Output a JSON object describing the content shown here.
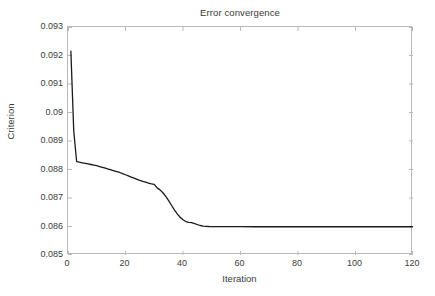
{
  "chart_data": {
    "type": "line",
    "title": "Error convergence",
    "xlabel": "Iteration",
    "ylabel": "Criterion",
    "xlim": [
      0,
      120
    ],
    "ylim": [
      0.085,
      0.093
    ],
    "xticks": [
      0,
      20,
      40,
      60,
      80,
      100,
      120
    ],
    "xtick_labels": [
      "0",
      "20",
      "40",
      "60",
      "80",
      "100",
      "120"
    ],
    "yticks": [
      0.085,
      0.086,
      0.087,
      0.088,
      0.089,
      0.09,
      0.091,
      0.092,
      0.093
    ],
    "ytick_labels": [
      "0.085",
      "0.086",
      "0.087",
      "0.088",
      "0.089",
      "0.09",
      "0.091",
      "0.092",
      "0.093"
    ],
    "grid": false,
    "legend": null,
    "line_color": "#1a1a1a",
    "line_width": 1.3,
    "series": [
      {
        "name": "Criterion",
        "x": [
          1,
          2,
          3,
          4,
          5,
          6,
          7,
          8,
          9,
          10,
          11,
          12,
          13,
          14,
          15,
          16,
          17,
          18,
          19,
          20,
          21,
          22,
          23,
          24,
          25,
          26,
          27,
          28,
          29,
          30,
          31,
          32,
          33,
          34,
          35,
          36,
          37,
          38,
          39,
          40,
          41,
          42,
          43,
          44,
          45,
          46,
          47,
          48,
          49,
          50,
          52,
          54,
          56,
          58,
          60,
          65,
          70,
          75,
          80,
          85,
          90,
          95,
          100,
          105,
          110,
          115,
          120
        ],
        "y": [
          0.09215,
          0.08935,
          0.08828,
          0.088255,
          0.088235,
          0.088215,
          0.088195,
          0.088175,
          0.088155,
          0.088135,
          0.088105,
          0.088075,
          0.088045,
          0.088015,
          0.087985,
          0.087955,
          0.087925,
          0.087895,
          0.087855,
          0.087815,
          0.087775,
          0.087735,
          0.087695,
          0.087655,
          0.087615,
          0.087585,
          0.087555,
          0.087525,
          0.087495,
          0.08748,
          0.087355,
          0.087285,
          0.087185,
          0.087055,
          0.086905,
          0.086745,
          0.086585,
          0.086445,
          0.086325,
          0.086235,
          0.086175,
          0.086145,
          0.086135,
          0.086105,
          0.086065,
          0.086035,
          0.086015,
          0.086005,
          0.086,
          0.085998,
          0.085996,
          0.085995,
          0.085994,
          0.085993,
          0.085993,
          0.085992,
          0.085992,
          0.085992,
          0.085992,
          0.085992,
          0.085992,
          0.085992,
          0.085992,
          0.085992,
          0.085992,
          0.085992,
          0.085992
        ]
      }
    ]
  }
}
